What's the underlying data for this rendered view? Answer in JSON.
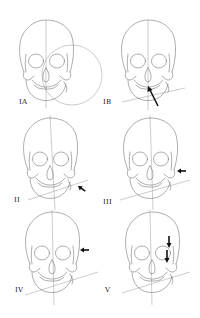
{
  "diagram": {
    "type": "figure-panels",
    "colors": {
      "background": "#ffffff",
      "line": "#6a6a6a",
      "arrow": "#111111"
    },
    "panels": [
      {
        "id": "IA",
        "label": "IA",
        "row": 0,
        "col": 0,
        "guides": [
          "vertical-midline",
          "large-circle"
        ],
        "arrow": null
      },
      {
        "id": "IB",
        "label": "IB",
        "row": 0,
        "col": 1,
        "guides": [
          "vertical-midline",
          "tilted-line"
        ],
        "arrow": {
          "target": "nasal-aperture",
          "direction": "up-left"
        }
      },
      {
        "id": "II",
        "label": "II",
        "row": 1,
        "col": 0,
        "guides": [
          "vertical-midline",
          "tilted-line"
        ],
        "arrow": {
          "target": "jaw-angle",
          "direction": "up-left"
        }
      },
      {
        "id": "III",
        "label": "III",
        "row": 1,
        "col": 1,
        "guides": [
          "vertical-midline",
          "tilted-line"
        ],
        "arrow": {
          "target": "zygomatic-arch",
          "direction": "left"
        }
      },
      {
        "id": "IV",
        "label": "IV",
        "row": 2,
        "col": 0,
        "guides": [
          "vertical-midline",
          "tilted-line"
        ],
        "arrow": {
          "target": "orbit-edge",
          "direction": "left"
        }
      },
      {
        "id": "V",
        "label": "V",
        "row": 2,
        "col": 1,
        "guides": [
          "vertical-midline",
          "tilted-line"
        ],
        "arrow": {
          "target": "orbit",
          "direction": "down",
          "count": 2
        }
      }
    ]
  }
}
